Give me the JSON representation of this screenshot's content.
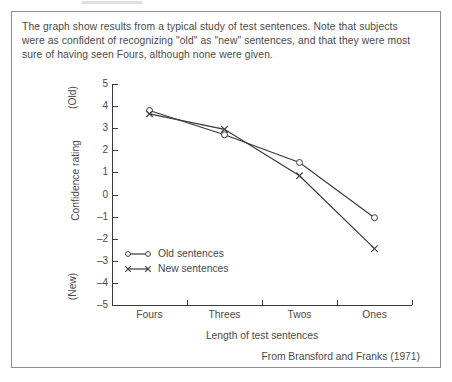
{
  "caption": {
    "line1": "The graph show results from a typical study of test sentences.  Note that subjects",
    "line2": "were as confident of recognizing \"old\" as \"new\" sentences, and that they were most",
    "line3": "sure of having seen Fours, although none were given."
  },
  "attribution": "From Bransford and Franks (1971)",
  "axis": {
    "y_title": "Confidence rating",
    "y_top_pole": "(Old)",
    "y_bottom_pole": "(New)",
    "x_title": "Length of test sentences"
  },
  "legend": {
    "old_label": "Old sentences",
    "new_label": "New sentences",
    "old_marker": "circle-marker",
    "new_marker": "x-marker"
  },
  "colors": {
    "ink": "#3a3a3a",
    "text": "#4a4a4a",
    "frame": "#8d8d8d",
    "background": "#ffffff"
  },
  "chart_data": {
    "type": "line",
    "title": "",
    "xlabel": "Length of test sentences",
    "ylabel": "Confidence rating",
    "categories": [
      "Fours",
      "Threes",
      "Twos",
      "Ones"
    ],
    "ylim": [
      -5,
      5
    ],
    "yticks": [
      5,
      4,
      3,
      2,
      1,
      0,
      -1,
      -2,
      -3,
      -4,
      -5
    ],
    "ytick_labels": [
      "5",
      "4",
      "3",
      "2",
      "1",
      "0",
      "-1",
      "-2",
      "-3",
      "-4",
      "-5"
    ],
    "y_pole_top": "(Old)",
    "y_pole_bottom": "(New)",
    "grid": false,
    "legend_position": "inside-lower-left",
    "series": [
      {
        "name": "Old sentences",
        "marker": "circle",
        "values": [
          3.8,
          2.7,
          1.45,
          -1.05
        ]
      },
      {
        "name": "New sentences",
        "marker": "x",
        "values": [
          3.65,
          2.95,
          0.85,
          -2.45
        ]
      }
    ]
  }
}
